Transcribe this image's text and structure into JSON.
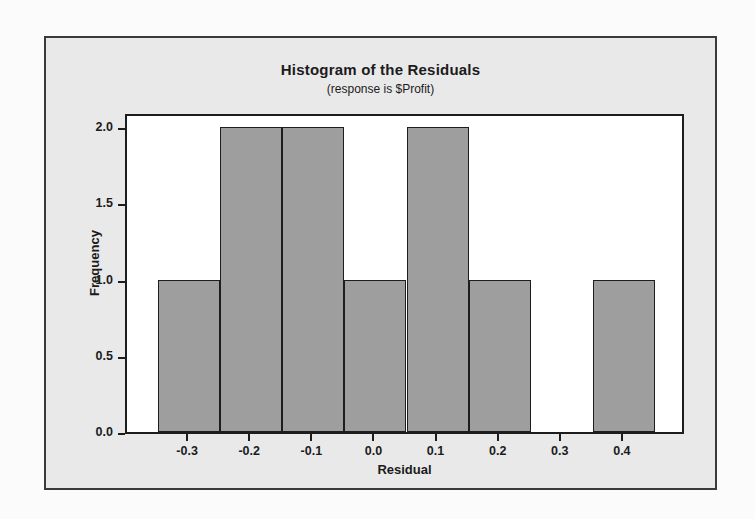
{
  "chart_data": {
    "type": "bar",
    "title": "Histogram of the Residuals",
    "subtitle": "(response is $Profit)",
    "xlabel": "Residual",
    "ylabel": "Frequency",
    "categories": [
      "-0.3",
      "-0.2",
      "-0.1",
      "0.0",
      "0.1",
      "0.2",
      "0.3",
      "0.4"
    ],
    "values": [
      1,
      2,
      2,
      1,
      2,
      1,
      0,
      1
    ],
    "bin_width": 0.1,
    "bin_edges": [
      -0.35,
      -0.25,
      -0.15,
      -0.05,
      0.05,
      0.15,
      0.25,
      0.35,
      0.45
    ],
    "xlim": [
      -0.4,
      0.5
    ],
    "ylim": [
      0,
      2.1
    ],
    "yticks": [
      "0.0",
      "0.5",
      "1.0",
      "1.5",
      "2.0"
    ],
    "ytick_values": [
      0.0,
      0.5,
      1.0,
      1.5,
      2.0
    ],
    "xticks": [
      "-0.3",
      "-0.2",
      "-0.1",
      "0.0",
      "0.1",
      "0.2",
      "0.3",
      "0.4"
    ],
    "xtick_values": [
      -0.3,
      -0.2,
      -0.1,
      0.0,
      0.1,
      0.2,
      0.3,
      0.4
    ],
    "grid": false,
    "legend": null,
    "total_count": 10,
    "bar_fill_color": "#9e9e9e",
    "bar_edge_color": "#1d1d1d",
    "plot_background_color": "#ffffff",
    "figure_background_color": "#e9e9e9",
    "frame_color": "#3a3a3a"
  }
}
